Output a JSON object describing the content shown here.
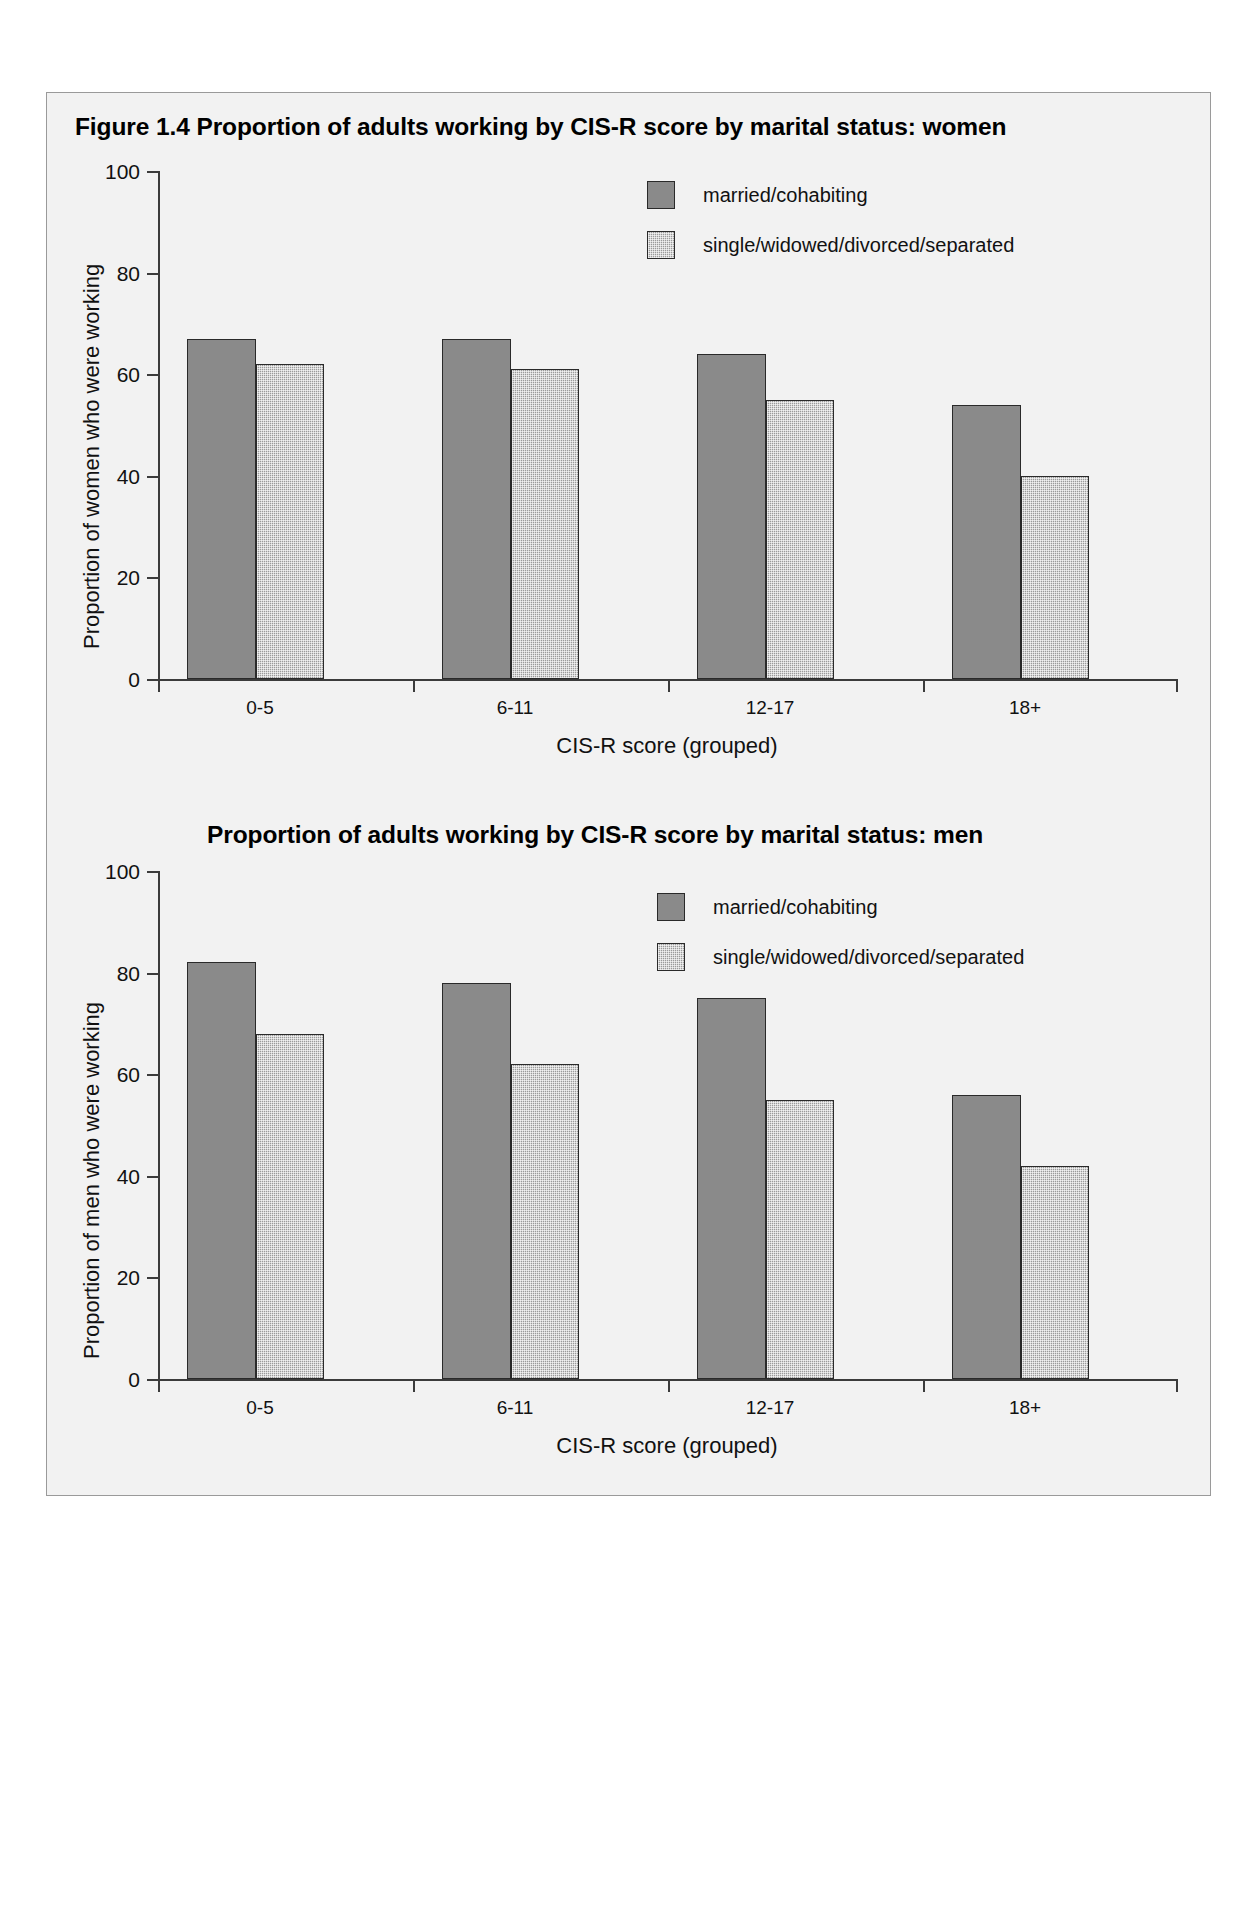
{
  "page": {
    "figure_number": "Figure 1.4",
    "background_color": "#f2f2f2",
    "bar_color_solid": "#8a8a8a",
    "bar_color_stipple": "#9b9b9b",
    "axis_color": "#3b3b3b"
  },
  "chart_data": [
    {
      "type": "bar",
      "id": "women",
      "title": "Figure 1.4   Proportion of adults working by CIS-R score by marital status: women",
      "title_prefix": "Figure 1.4",
      "title_text": "Proportion of adults working by CIS-R score by marital status: women",
      "xlabel": "CIS-R score (grouped)",
      "ylabel": "Proportion of women who were working",
      "categories": [
        "0-5",
        "6-11",
        "12-17",
        "18+"
      ],
      "ylim": [
        0,
        100
      ],
      "yticks": [
        0,
        20,
        40,
        60,
        80,
        100
      ],
      "ytick_labels": [
        "0",
        "20",
        "40",
        "60",
        "80",
        "100"
      ],
      "grid": false,
      "legend_position": "top-right",
      "series": [
        {
          "name": "married/cohabiting",
          "fill": "solid",
          "values": [
            67,
            67,
            64,
            54
          ]
        },
        {
          "name": "single/widowed/divorced/separated",
          "fill": "stipple",
          "values": [
            62,
            61,
            55,
            40
          ]
        }
      ]
    },
    {
      "type": "bar",
      "id": "men",
      "title": "Proportion of adults working by CIS-R score by marital status: men",
      "title_text": "Proportion of adults working by CIS-R score by marital status: men",
      "xlabel": "CIS-R score (grouped)",
      "ylabel": "Proportion of men who were working",
      "categories": [
        "0-5",
        "6-11",
        "12-17",
        "18+"
      ],
      "ylim": [
        0,
        100
      ],
      "yticks": [
        0,
        20,
        40,
        60,
        80,
        100
      ],
      "ytick_labels": [
        "0",
        "20",
        "40",
        "60",
        "80",
        "100"
      ],
      "grid": false,
      "legend_position": "top-right",
      "series": [
        {
          "name": "married/cohabiting",
          "fill": "solid",
          "values": [
            82,
            78,
            75,
            56
          ]
        },
        {
          "name": "single/widowed/divorced/separated",
          "fill": "stipple",
          "values": [
            68,
            62,
            55,
            42
          ]
        }
      ]
    }
  ]
}
